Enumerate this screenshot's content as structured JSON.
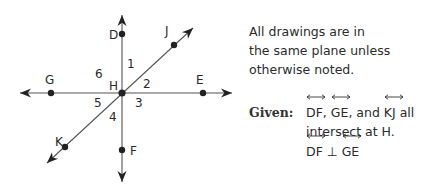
{
  "diagram": {
    "intersection": {
      "label": "H",
      "x": 122,
      "y": 93
    },
    "lines": [
      {
        "name": "DF",
        "from": [
          122,
          15
        ],
        "to": [
          122,
          182
        ],
        "arrows": "both"
      },
      {
        "name": "GE",
        "from": [
          20,
          93
        ],
        "to": [
          232,
          93
        ],
        "arrows": "both"
      },
      {
        "name": "KJ",
        "from": [
          47,
          163
        ],
        "to": [
          193,
          28
        ],
        "arrows": "both"
      }
    ],
    "points": [
      {
        "label": "D",
        "x": 122,
        "y": 34,
        "lx": 109,
        "ly": 39
      },
      {
        "label": "J",
        "x": 174,
        "y": 45,
        "lx": 165,
        "ly": 35
      },
      {
        "label": "G",
        "x": 51,
        "y": 93,
        "lx": 45,
        "ly": 84
      },
      {
        "label": "E",
        "x": 203,
        "y": 93,
        "lx": 196,
        "ly": 84
      },
      {
        "label": "K",
        "x": 65,
        "y": 147,
        "lx": 55,
        "ly": 146
      },
      {
        "label": "F",
        "x": 122,
        "y": 150,
        "lx": 130,
        "ly": 155
      }
    ],
    "intersection_label": {
      "text": "H",
      "x": 109,
      "y": 90
    },
    "angles": [
      {
        "label": "1",
        "x": 127,
        "y": 68
      },
      {
        "label": "2",
        "x": 143,
        "y": 88
      },
      {
        "label": "3",
        "x": 135,
        "y": 107
      },
      {
        "label": "4",
        "x": 109,
        "y": 121
      },
      {
        "label": "5",
        "x": 94,
        "y": 107
      },
      {
        "label": "6",
        "x": 95,
        "y": 78
      }
    ]
  },
  "note": {
    "lines": [
      "All drawings are in",
      "the same plane unless",
      "otherwise noted."
    ]
  },
  "given": {
    "label": "Given:",
    "line1": {
      "lines": [
        "DF",
        "GE",
        "KJ"
      ],
      "sep1": ", ",
      "sep2": ", and ",
      "tail": " all"
    },
    "line2": "intersect at H.",
    "line3": {
      "left": "DF",
      "symbol": " ⊥ ",
      "right": "GE"
    }
  }
}
